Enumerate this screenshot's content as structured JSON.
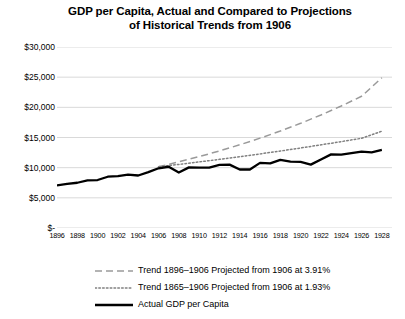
{
  "chart_data": {
    "type": "line",
    "title": "GDP per Capita, Actual and Compared to Projections of Historical Trends from 1906",
    "title_line1": "GDP per Capita, Actual and Compared to Projections",
    "title_line2": "of Historical Trends from 1906",
    "xlabel": "",
    "ylabel": "",
    "grid": true,
    "legend_position": "bottom",
    "ylim": [
      0,
      30000
    ],
    "xlim": [
      1896,
      1929
    ],
    "ytick_labels": [
      "$30,000",
      "$25,000",
      "$20,000",
      "$15,000",
      "$10,000",
      "$5,000",
      "$-"
    ],
    "ytick_values": [
      30000,
      25000,
      20000,
      15000,
      10000,
      5000,
      0
    ],
    "xtick_labels": [
      "1896",
      "1898",
      "1900",
      "1902",
      "1904",
      "1906",
      "1908",
      "1910",
      "1912",
      "1914",
      "1916",
      "1918",
      "1920",
      "1922",
      "1924",
      "1926",
      "1928"
    ],
    "xtick_values": [
      1896,
      1898,
      1900,
      1902,
      1904,
      1906,
      1908,
      1910,
      1912,
      1914,
      1916,
      1918,
      1920,
      1922,
      1924,
      1926,
      1928
    ],
    "x": [
      1896,
      1897,
      1898,
      1899,
      1900,
      1901,
      1902,
      1903,
      1904,
      1905,
      1906,
      1907,
      1908,
      1909,
      1910,
      1911,
      1912,
      1913,
      1914,
      1915,
      1916,
      1917,
      1918,
      1919,
      1920,
      1921,
      1922,
      1923,
      1924,
      1925,
      1926,
      1927,
      1928
    ],
    "series": [
      {
        "name": "Trend 1896–1906 Projected from 1906 at 3.91%",
        "style": "dashed",
        "color": "#9a9a9a",
        "rate": 3.91,
        "x": [
          1906,
          1908,
          1910,
          1912,
          1914,
          1916,
          1918,
          1920,
          1922,
          1924,
          1926,
          1928
        ],
        "values": [
          10150,
          10960,
          11830,
          12770,
          13790,
          14890,
          16070,
          17350,
          18730,
          20220,
          21830,
          24900
        ]
      },
      {
        "name": "Trend 1865–1906 Projected from 1906 at 1.93%",
        "style": "dotted",
        "color": "#808080",
        "rate": 1.93,
        "x": [
          1906,
          1908,
          1910,
          1912,
          1914,
          1916,
          1918,
          1920,
          1922,
          1924,
          1926,
          1928
        ],
        "values": [
          10150,
          10540,
          10950,
          11380,
          11820,
          12280,
          12760,
          13260,
          13780,
          14310,
          14870,
          16050
        ]
      },
      {
        "name": "Actual GDP per Capita",
        "style": "solid",
        "color": "#000000",
        "values": [
          7050,
          7300,
          7500,
          7900,
          7950,
          8500,
          8600,
          8850,
          8700,
          9250,
          9900,
          10150,
          9200,
          10050,
          10000,
          10000,
          10450,
          10500,
          9700,
          9700,
          10800,
          10700,
          11300,
          11000,
          10950,
          10500,
          11350,
          12200,
          12150,
          12400,
          12650,
          12550,
          12950
        ]
      }
    ]
  }
}
